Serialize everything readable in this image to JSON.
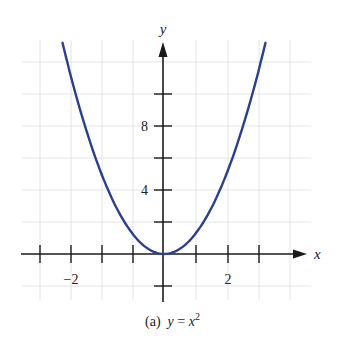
{
  "chart_data": {
    "type": "line",
    "caption": {
      "prefix": "(a)",
      "lhs": "y",
      "eq": "=",
      "base": "x",
      "exp": "2"
    },
    "function": "y = x^2",
    "xlabel": "x",
    "ylabel": "y",
    "x_tick_labels": [
      {
        "label": "−2",
        "value": -2
      },
      {
        "label": "2",
        "value": 2
      }
    ],
    "y_tick_labels": [
      {
        "label": "4",
        "value": 4
      },
      {
        "label": "8",
        "value": 8
      }
    ],
    "y_ticks": [
      -2,
      2,
      4,
      6,
      8,
      10
    ],
    "xlim": [
      -4,
      4.5
    ],
    "ylim": [
      -3,
      13
    ],
    "grid": true,
    "series": [
      {
        "name": "y = x^2",
        "color": "#2b3f8c",
        "x": [
          -3.6,
          -3,
          -2.5,
          -2,
          -1.5,
          -1,
          -0.5,
          0,
          0.5,
          1,
          1.5,
          2,
          2.5,
          3,
          3.6
        ],
        "y": [
          12.96,
          9,
          6.25,
          4,
          2.25,
          1,
          0.25,
          0,
          0.25,
          1,
          2.25,
          4,
          6.25,
          9,
          12.96
        ]
      }
    ]
  },
  "labels": {
    "x_axis": "x",
    "y_axis": "y",
    "x_tick_neg2": "−2",
    "x_tick_2": "2",
    "y_tick_4": "4",
    "y_tick_8": "8",
    "caption_prefix": "(a)",
    "caption_lhs": "y",
    "caption_eq": "=",
    "caption_base": "x",
    "caption_exp": "2"
  },
  "colors": {
    "curve": "#2b3f8c",
    "axes": "#1a1a1a",
    "grid": "#e4e4e4"
  }
}
